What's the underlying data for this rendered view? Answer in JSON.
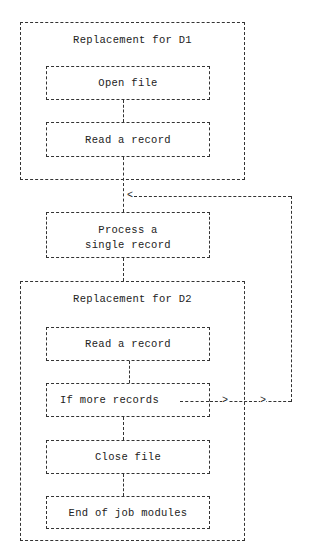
{
  "diagram": {
    "groups": [
      {
        "id": "d1",
        "title": "Replacement for D1",
        "steps": [
          {
            "id": "open-file",
            "label": "Open file"
          },
          {
            "id": "read-record-1",
            "label": "Read a record"
          }
        ]
      },
      {
        "id": "d2",
        "title": "Replacement for D2",
        "steps": [
          {
            "id": "read-record-2",
            "label": "Read a record"
          },
          {
            "id": "if-more",
            "label": "If more records"
          },
          {
            "id": "close-file",
            "label": "Close file"
          },
          {
            "id": "end-of-job",
            "label": "End of job modules"
          }
        ]
      }
    ],
    "process": {
      "line1": "Process a",
      "line2": "single record"
    },
    "arrows": {
      "loop_back_head": "<",
      "loop_out_head_1": ">",
      "loop_out_head_2": ">"
    },
    "edges": [
      {
        "from": "open-file",
        "to": "read-record-1"
      },
      {
        "from": "read-record-1",
        "to": "process"
      },
      {
        "from": "process",
        "to": "read-record-2"
      },
      {
        "from": "read-record-2",
        "to": "if-more"
      },
      {
        "from": "if-more",
        "to": "process",
        "type": "loop-back"
      },
      {
        "from": "if-more",
        "to": "close-file"
      },
      {
        "from": "close-file",
        "to": "end-of-job"
      }
    ]
  }
}
